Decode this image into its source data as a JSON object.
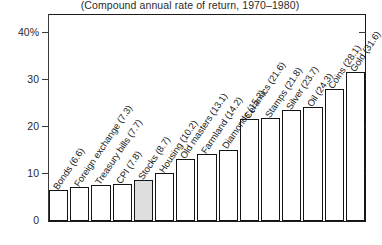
{
  "chart_data": {
    "type": "bar",
    "title": "(Compound annual rate of return, 1970–1980)",
    "xlabel": "",
    "ylabel": "",
    "ylim": [
      0,
      44
    ],
    "grid": false,
    "legend": "none",
    "highlight_category": "Stocks",
    "ytick_labels": [
      "0",
      "10",
      "20",
      "30",
      "40%"
    ],
    "ytick_values": [
      0,
      10,
      20,
      30,
      40
    ],
    "categories": [
      "Bonds",
      "Foreign exchange",
      "Treasury bills",
      "CPI",
      "Stocks",
      "Housing",
      "Old masters",
      "Farmland",
      "Diamonds",
      "Ceramics",
      "Stamps",
      "Silver",
      "Oil",
      "Coins",
      "Gold"
    ],
    "values": [
      6.6,
      7.3,
      7.7,
      7.8,
      8.7,
      10.2,
      13.1,
      14.2,
      15.2,
      21.6,
      21.8,
      23.7,
      24.3,
      28.1,
      31.6
    ],
    "bar_labels": [
      "Bonds (6.6)",
      "Foreign exchange (7.3)",
      "Treasury bills (7.7)",
      "CPI (7.8)",
      "Stocks (8.7)",
      "Housing (10.2)",
      "Old masters (13.1)",
      "Farmland (14.2)",
      "Diamonds (15.2)",
      "Ceramics (21.6)",
      "Stamps (21.8)",
      "Silver (23.7)",
      "Oil (24.3)",
      "Coins (28.1)",
      "Gold (31.6)"
    ]
  }
}
